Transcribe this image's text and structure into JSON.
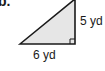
{
  "problem": {
    "label": "b."
  },
  "triangle": {
    "type": "right-triangle",
    "fill_color": "#e6e6e6",
    "stroke_color": "#1a1a1a",
    "right_angle_marker": true,
    "height_label": "5 yd",
    "base_label": "6 yd",
    "height_value": 5,
    "base_value": 6,
    "unit": "yd"
  }
}
